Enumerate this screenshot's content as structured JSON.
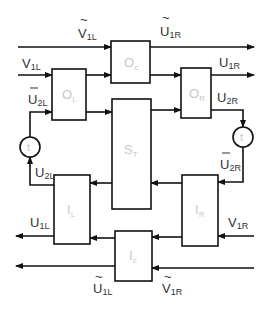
{
  "diagram": {
    "blocks": {
      "oc": {
        "main": "O",
        "sub": "c"
      },
      "ol": {
        "main": "O",
        "sub": "L"
      },
      "or": {
        "main": "O",
        "sub": "R"
      },
      "st": {
        "main": "S",
        "sub": "T"
      },
      "il": {
        "main": "I",
        "sub": "L"
      },
      "ir": {
        "main": "I",
        "sub": "R"
      },
      "ic": {
        "main": "I",
        "sub": "c"
      }
    },
    "time_nodes": {
      "left": "t",
      "right": "t"
    },
    "signals": {
      "v1l_tilde": {
        "main": "V",
        "sub": "1L",
        "accent": "~"
      },
      "u1r_tilde": {
        "main": "U",
        "sub": "1R",
        "accent": "~"
      },
      "v1l": {
        "main": "V",
        "sub": "1L"
      },
      "u1r": {
        "main": "U",
        "sub": "1R"
      },
      "u2l_bar": {
        "main": "U",
        "sub": "2L",
        "accent": "‾"
      },
      "u2r": {
        "main": "U",
        "sub": "2R"
      },
      "u2l": {
        "main": "U",
        "sub": "2L"
      },
      "u2r_bar": {
        "main": "U",
        "sub": "2R",
        "accent": "‾"
      },
      "u1l": {
        "main": "U",
        "sub": "1L"
      },
      "v1r": {
        "main": "V",
        "sub": "1R"
      },
      "u1l_tilde": {
        "main": "U",
        "sub": "1L",
        "accent": "~"
      },
      "v1r_tilde": {
        "main": "V",
        "sub": "1R",
        "accent": "~"
      }
    }
  }
}
